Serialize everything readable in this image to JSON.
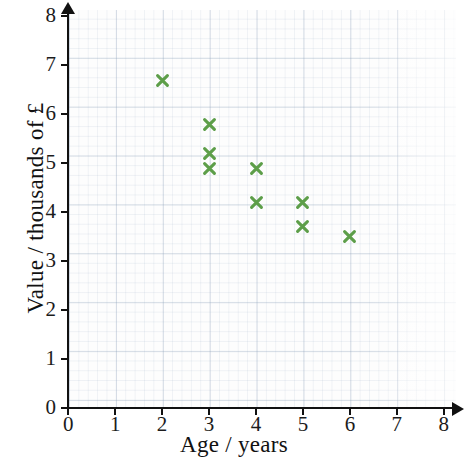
{
  "chart_data": {
    "type": "scatter",
    "title": "",
    "xlabel": "Age / years",
    "ylabel": "Value / thousands of £",
    "xlim": [
      0,
      8
    ],
    "ylim": [
      0,
      8
    ],
    "xticks": [
      "0",
      "1",
      "2",
      "3",
      "4",
      "5",
      "6",
      "7",
      "8"
    ],
    "yticks": [
      "0",
      "1",
      "2",
      "3",
      "4",
      "5",
      "6",
      "7",
      "8"
    ],
    "grid": true,
    "grid_style": "graph-paper",
    "legend": null,
    "marker": "x",
    "marker_color": "#5d9e49",
    "series": [
      {
        "name": "Car value vs age",
        "points": [
          {
            "x": 2,
            "y": 6.7
          },
          {
            "x": 3,
            "y": 5.8
          },
          {
            "x": 3,
            "y": 5.2
          },
          {
            "x": 3,
            "y": 4.9
          },
          {
            "x": 4,
            "y": 4.9
          },
          {
            "x": 4,
            "y": 4.2
          },
          {
            "x": 5,
            "y": 4.2
          },
          {
            "x": 5,
            "y": 3.7
          },
          {
            "x": 6,
            "y": 3.5
          }
        ]
      }
    ]
  },
  "axes": {
    "x_axis_name": "x-axis",
    "y_axis_name": "y-axis"
  }
}
